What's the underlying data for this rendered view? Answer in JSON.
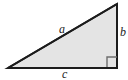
{
  "figure": {
    "background_color": "#ffffff",
    "labels": {
      "hypotenuse": "a",
      "vertical_leg": "b",
      "horizontal_leg": "c"
    },
    "right_angle_marker": "right-angle-square",
    "style": {
      "fill_color": "#e4e4e4",
      "stroke_color": "#1c1c1c",
      "stroke_width": 2,
      "marker_stroke_color": "#6e6e6e",
      "label_color": "#1c1c1c"
    },
    "geometry": {
      "left_vertex": [
        8,
        68
      ],
      "right_vertex": [
        117,
        68
      ],
      "apex_vertex": [
        117,
        4
      ],
      "marker_rect": [
        107,
        57,
        10,
        10
      ]
    }
  }
}
